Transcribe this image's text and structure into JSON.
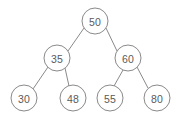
{
  "diagram": {
    "type": "binary-search-tree",
    "canvas": {
      "width": 182,
      "height": 121,
      "background": "#ffffff"
    },
    "style": {
      "node_fill": "#ffffff",
      "node_stroke": "#8a8a8a",
      "edge_stroke": "#8a8a8a",
      "label_color": "#5a5a5a",
      "node_radius": 13,
      "stroke_width": 1
    },
    "nodes": [
      {
        "id": "n50",
        "label": "50",
        "cx": 95,
        "cy": 21,
        "level": 0,
        "role": "root"
      },
      {
        "id": "n35",
        "label": "35",
        "cx": 57,
        "cy": 58,
        "level": 1,
        "role": "left-child"
      },
      {
        "id": "n60",
        "label": "60",
        "cx": 128,
        "cy": 58,
        "level": 1,
        "role": "right-child"
      },
      {
        "id": "n30",
        "label": "30",
        "cx": 24,
        "cy": 98,
        "level": 2,
        "role": "leaf"
      },
      {
        "id": "n48",
        "label": "48",
        "cx": 73,
        "cy": 98,
        "level": 2,
        "role": "leaf"
      },
      {
        "id": "n55",
        "label": "55",
        "cx": 110,
        "cy": 98,
        "level": 2,
        "role": "leaf"
      },
      {
        "id": "n80",
        "label": "80",
        "cx": 157,
        "cy": 98,
        "level": 2,
        "role": "leaf"
      }
    ],
    "edges": [
      {
        "id": "e50-35",
        "from": "n50",
        "to": "n35",
        "x1": 84,
        "y1": 28,
        "x2": 68,
        "y2": 51
      },
      {
        "id": "e50-60",
        "from": "n50",
        "to": "n60",
        "x1": 106,
        "y1": 28,
        "x2": 117,
        "y2": 51
      },
      {
        "id": "e35-30",
        "from": "n35",
        "to": "n30",
        "x1": 48,
        "y1": 67,
        "x2": 33,
        "y2": 89
      },
      {
        "id": "e35-48",
        "from": "n35",
        "to": "n48",
        "x1": 65,
        "y1": 68,
        "x2": 69,
        "y2": 86
      },
      {
        "id": "e60-55",
        "from": "n60",
        "to": "n55",
        "x1": 123,
        "y1": 70,
        "x2": 114,
        "y2": 86
      },
      {
        "id": "e60-80",
        "from": "n60",
        "to": "n80",
        "x1": 137,
        "y1": 67,
        "x2": 148,
        "y2": 88
      }
    ]
  }
}
